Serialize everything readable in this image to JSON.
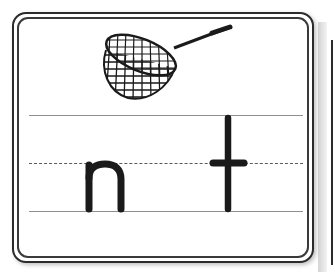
{
  "worksheet": {
    "picture": {
      "label": "net",
      "icon": "net-icon"
    },
    "letters": [
      "n",
      "t"
    ],
    "guide_lines": [
      "top-line",
      "dashed-midline",
      "baseline"
    ],
    "colors": {
      "ink": "#1a1a1a",
      "border": "#2b2b2b",
      "guide_line": "#8f8f8f",
      "background": "#ffffff"
    }
  }
}
